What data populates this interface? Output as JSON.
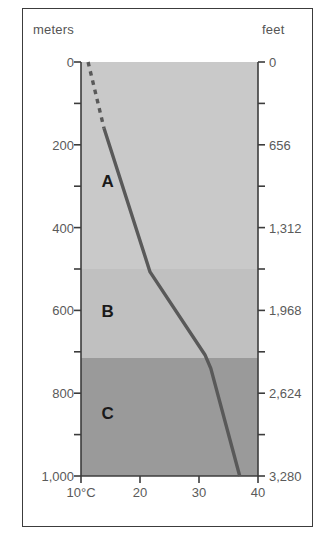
{
  "figure": {
    "left_axis_title": "meters",
    "right_axis_title": "feet"
  },
  "chart_data": {
    "type": "line",
    "title": "",
    "subtitle": "",
    "xlabel": "",
    "ylabel": "meters",
    "y2label": "feet",
    "grid": false,
    "legend_position": "none",
    "orientation": "depth-profile (y axis inverted, depth increases downward)",
    "x": {
      "tick_labels": [
        "10°C",
        "20",
        "30",
        "40"
      ],
      "tick_values": [
        10,
        20,
        30,
        40
      ],
      "xlim": [
        10,
        40
      ],
      "units": "°C"
    },
    "y_left": {
      "tick_labels": [
        "0",
        "200",
        "400",
        "600",
        "800",
        "1,000"
      ],
      "tick_values": [
        0,
        200,
        400,
        600,
        800,
        1000
      ],
      "minor_tick_values": [
        100,
        300,
        500,
        700,
        900
      ],
      "ylim": [
        0,
        1000
      ],
      "units": "meters"
    },
    "y_right": {
      "tick_labels": [
        "0",
        "656",
        "1,312",
        "1,968",
        "2,624",
        "3,280"
      ],
      "tick_values": [
        0,
        656,
        1312,
        1968,
        2624,
        3280
      ],
      "ylim": [
        0,
        3280
      ],
      "units": "feet"
    },
    "series": [
      {
        "name": "temperature-profile-dashed",
        "style": "dashed",
        "color": "#595959",
        "points": [
          {
            "temp_c": 11.2,
            "depth_m": 0
          },
          {
            "temp_c": 13.9,
            "depth_m": 160
          }
        ]
      },
      {
        "name": "temperature-profile-solid",
        "style": "solid",
        "color": "#595959",
        "points": [
          {
            "temp_c": 13.9,
            "depth_m": 160
          },
          {
            "temp_c": 21.7,
            "depth_m": 507
          },
          {
            "temp_c": 31.0,
            "depth_m": 707
          },
          {
            "temp_c": 32.0,
            "depth_m": 740
          },
          {
            "temp_c": 36.9,
            "depth_m": 1000
          }
        ]
      }
    ],
    "bands": [
      {
        "label": "A",
        "depth_top_m": 0,
        "depth_bottom_m": 500,
        "color": "#c9c9c9"
      },
      {
        "label": "B",
        "depth_top_m": 500,
        "depth_bottom_m": 715,
        "color": "#c0c0c0"
      },
      {
        "label": "C",
        "depth_top_m": 715,
        "depth_bottom_m": 1000,
        "color": "#9a9a9a"
      }
    ],
    "annotations": [
      {
        "text": "A",
        "temp_c": 14.5,
        "depth_m": 290
      },
      {
        "text": "B",
        "temp_c": 14.5,
        "depth_m": 605
      },
      {
        "text": "C",
        "temp_c": 14.5,
        "depth_m": 850
      }
    ]
  },
  "colors": {
    "band_a": "#c9c9c9",
    "band_b": "#c0c0c0",
    "band_c": "#9a9a9a",
    "curve": "#595959",
    "axis": "#3c3c3c",
    "tick_text": "#5a5a5a",
    "frame": "#3c3c3c",
    "background": "#ffffff"
  }
}
